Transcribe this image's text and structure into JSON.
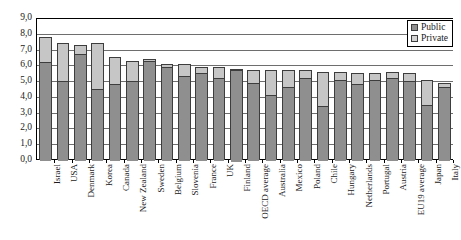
{
  "chart_data": {
    "type": "bar",
    "stacked": true,
    "title": "",
    "subtitle": "",
    "xlabel": "",
    "ylabel": "",
    "ylim": [
      0.0,
      9.0
    ],
    "ytick_step": 1.0,
    "ytick_labels": [
      "9,0",
      "8,0",
      "7,0",
      "6,0",
      "5,0",
      "4,0",
      "3,0",
      "2,0",
      "1,0",
      "0,0"
    ],
    "ytick_values": [
      9.0,
      8.0,
      7.0,
      6.0,
      5.0,
      4.0,
      3.0,
      2.0,
      1.0,
      0.0
    ],
    "grid": true,
    "legend_position": "top-right",
    "decimal_separator": ",",
    "categories": [
      "Israel",
      "USA",
      "Denmark",
      "Korea",
      "Canada",
      "New Zealand",
      "Sweden",
      "Belgium",
      "Slovenia",
      "France",
      "UK",
      "Finland",
      "OECD average",
      "Australia",
      "Mexico",
      "Poland",
      "Chile",
      "Hungary",
      "Netherlands",
      "Portugal",
      "Austria",
      "EU19 average",
      "Japan",
      "Italy"
    ],
    "series": [
      {
        "name": "Public",
        "color": "#8f8f8f",
        "values": [
          6.2,
          5.0,
          6.7,
          4.5,
          4.8,
          5.0,
          6.3,
          5.9,
          5.3,
          5.5,
          5.2,
          5.8,
          4.9,
          4.1,
          4.6,
          5.2,
          3.4,
          5.1,
          4.8,
          5.1,
          5.2,
          5.0,
          3.5,
          4.6
        ]
      },
      {
        "name": "Private",
        "color": "#c6c6c6",
        "values": [
          1.6,
          2.4,
          0.6,
          2.9,
          1.7,
          1.3,
          0.1,
          0.2,
          0.8,
          0.4,
          0.7,
          0.0,
          0.8,
          1.6,
          1.1,
          0.5,
          2.2,
          0.5,
          0.7,
          0.4,
          0.4,
          0.5,
          1.6,
          0.3
        ]
      }
    ],
    "totals": [
      7.8,
      7.4,
      7.3,
      7.4,
      6.5,
      6.3,
      6.4,
      6.1,
      6.1,
      5.9,
      5.9,
      5.8,
      5.7,
      5.7,
      5.7,
      5.7,
      5.6,
      5.6,
      5.5,
      5.5,
      5.6,
      5.5,
      5.1,
      4.9
    ]
  },
  "legend": {
    "items": [
      {
        "label": "Public"
      },
      {
        "label": "Private"
      }
    ]
  }
}
